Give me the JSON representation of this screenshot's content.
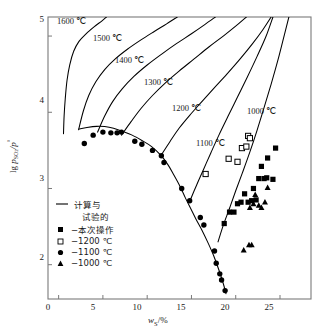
{
  "chart_data": {
    "type": "line",
    "title": "",
    "xlabel": "w_s/%",
    "ylabel": "lg p_so2 / p°",
    "xlim": [
      -1.2,
      28.5
    ],
    "ylim": [
      1.55,
      5.25
    ],
    "xticks": [
      0,
      5,
      10,
      15,
      20,
      25
    ],
    "yticks": [
      2,
      3,
      4,
      5
    ],
    "grid": false,
    "legend_position": "inside-lower-left",
    "annotations": [
      {
        "text": "1600 ℃",
        "x": 1.6,
        "y": 5.06
      },
      {
        "text": "1500 ℃",
        "x": 5.6,
        "y": 4.77
      },
      {
        "text": "1400 ℃",
        "x": 8.1,
        "y": 4.53
      },
      {
        "text": "1300 ℃",
        "x": 11.4,
        "y": 4.24
      },
      {
        "text": "1200 ℃",
        "x": 14.6,
        "y": 3.92
      },
      {
        "text": "1100 ℃",
        "x": 17.6,
        "y": 3.47
      },
      {
        "text": "1000 ℃",
        "x": 23.4,
        "y": 3.84
      }
    ],
    "series": [
      {
        "name": "计算与试验的",
        "kind": "line",
        "marker": "none",
        "color": "#000000",
        "points": [
          [
            2.3,
            3.78
          ],
          [
            3.2,
            3.8
          ],
          [
            4.3,
            3.815
          ],
          [
            5.2,
            3.812
          ],
          [
            6.2,
            3.79
          ],
          [
            7.2,
            3.75
          ],
          [
            8.3,
            3.7
          ],
          [
            9.4,
            3.63
          ],
          [
            10.5,
            3.55
          ],
          [
            11.5,
            3.44
          ],
          [
            12.3,
            3.32
          ],
          [
            13.0,
            3.18
          ],
          [
            13.7,
            3.03
          ],
          [
            14.3,
            2.88
          ],
          [
            14.9,
            2.74
          ],
          [
            15.5,
            2.6
          ],
          [
            16.2,
            2.45
          ],
          [
            16.9,
            2.28
          ],
          [
            17.5,
            2.12
          ],
          [
            18.1,
            1.93
          ],
          [
            18.6,
            1.75
          ],
          [
            18.9,
            1.62
          ]
        ]
      },
      {
        "name": "1600 ℃ isotherm",
        "kind": "line",
        "marker": "none",
        "color": "#000000",
        "points": [
          [
            0.55,
            3.72
          ],
          [
            0.62,
            3.95
          ],
          [
            0.75,
            4.18
          ],
          [
            0.95,
            4.42
          ],
          [
            1.25,
            4.62
          ],
          [
            1.7,
            4.8
          ],
          [
            2.3,
            4.93
          ],
          [
            3.1,
            5.03
          ],
          [
            4.0,
            5.12
          ],
          [
            4.9,
            5.2
          ],
          [
            5.4,
            5.25
          ]
        ]
      },
      {
        "name": "1500 ℃ isotherm",
        "kind": "line",
        "marker": "none",
        "color": "#000000",
        "points": [
          [
            2.25,
            3.77
          ],
          [
            2.8,
            4.02
          ],
          [
            3.4,
            4.22
          ],
          [
            4.2,
            4.4
          ],
          [
            5.2,
            4.56
          ],
          [
            6.4,
            4.7
          ],
          [
            7.8,
            4.83
          ],
          [
            9.3,
            4.95
          ],
          [
            10.8,
            5.06
          ],
          [
            12.2,
            5.16
          ],
          [
            13.4,
            5.25
          ]
        ]
      },
      {
        "name": "1400 ℃ isotherm",
        "kind": "line",
        "marker": "none",
        "color": "#000000",
        "points": [
          [
            4.4,
            3.74
          ],
          [
            5.2,
            3.95
          ],
          [
            6.1,
            4.14
          ],
          [
            7.2,
            4.31
          ],
          [
            8.5,
            4.47
          ],
          [
            10.0,
            4.62
          ],
          [
            11.6,
            4.76
          ],
          [
            13.3,
            4.9
          ],
          [
            15.0,
            5.03
          ],
          [
            16.5,
            5.15
          ],
          [
            17.7,
            5.25
          ]
        ]
      },
      {
        "name": "1300 ℃ isotherm",
        "kind": "line",
        "marker": "none",
        "color": "#000000",
        "points": [
          [
            7.1,
            3.7
          ],
          [
            8.2,
            3.88
          ],
          [
            9.3,
            4.05
          ],
          [
            10.6,
            4.22
          ],
          [
            12.0,
            4.38
          ],
          [
            13.6,
            4.54
          ],
          [
            15.3,
            4.7
          ],
          [
            17.0,
            4.86
          ],
          [
            18.7,
            5.01
          ],
          [
            20.2,
            5.15
          ],
          [
            21.2,
            5.25
          ]
        ]
      },
      {
        "name": "1200 ℃ isotherm",
        "kind": "line",
        "marker": "none",
        "color": "#000000",
        "points": [
          [
            11.6,
            3.44
          ],
          [
            12.6,
            3.62
          ],
          [
            13.6,
            3.79
          ],
          [
            14.8,
            3.96
          ],
          [
            16.1,
            4.13
          ],
          [
            17.5,
            4.31
          ],
          [
            19.0,
            4.5
          ],
          [
            20.5,
            4.7
          ],
          [
            21.9,
            4.9
          ],
          [
            23.1,
            5.09
          ],
          [
            24.0,
            5.25
          ]
        ]
      },
      {
        "name": "1100 ℃ isotherm",
        "kind": "line",
        "marker": "none",
        "color": "#000000",
        "points": [
          [
            14.8,
            2.83
          ],
          [
            15.6,
            3.05
          ],
          [
            16.4,
            3.26
          ],
          [
            17.2,
            3.47
          ],
          [
            18.1,
            3.7
          ],
          [
            19.1,
            3.94
          ],
          [
            20.2,
            4.2
          ],
          [
            21.3,
            4.46
          ],
          [
            22.4,
            4.73
          ],
          [
            23.4,
            4.99
          ],
          [
            24.2,
            5.25
          ]
        ]
      },
      {
        "name": "1000 ℃ isotherm",
        "kind": "line",
        "marker": "none",
        "color": "#000000",
        "points": [
          [
            18.0,
            2.3
          ],
          [
            18.6,
            2.52
          ],
          [
            19.3,
            2.74
          ],
          [
            20.0,
            2.97
          ],
          [
            20.8,
            3.22
          ],
          [
            21.6,
            3.48
          ],
          [
            22.4,
            3.76
          ],
          [
            23.2,
            4.06
          ],
          [
            24.0,
            4.37
          ],
          [
            24.8,
            4.7
          ],
          [
            25.5,
            5.02
          ],
          [
            26.0,
            5.25
          ]
        ]
      },
      {
        "name": "本次操作",
        "kind": "scatter",
        "marker": "filled-square",
        "color": "#000000",
        "points": [
          [
            18.7,
            2.54
          ],
          [
            19.3,
            2.69
          ],
          [
            19.8,
            2.69
          ],
          [
            20.2,
            2.8
          ],
          [
            20.6,
            2.82
          ],
          [
            21.0,
            2.93
          ],
          [
            21.4,
            2.82
          ],
          [
            21.8,
            2.84
          ],
          [
            22.0,
            3.0
          ],
          [
            22.3,
            2.85
          ],
          [
            22.6,
            3.13
          ],
          [
            22.9,
            3.29
          ],
          [
            23.2,
            3.13
          ],
          [
            23.5,
            3.14
          ],
          [
            23.6,
            3.4
          ],
          [
            24.2,
            3.12
          ],
          [
            24.5,
            3.53
          ]
        ]
      },
      {
        "name": "1200 ℃",
        "kind": "scatter",
        "marker": "open-square",
        "color": "#000000",
        "points": [
          [
            16.6,
            3.19
          ],
          [
            19.2,
            3.39
          ],
          [
            20.2,
            3.35
          ],
          [
            20.7,
            3.53
          ],
          [
            21.2,
            3.55
          ],
          [
            21.4,
            3.69
          ],
          [
            21.6,
            3.66
          ]
        ]
      },
      {
        "name": "1100 ℃",
        "kind": "scatter",
        "marker": "filled-circle",
        "color": "#000000",
        "points": [
          [
            2.9,
            3.59
          ],
          [
            3.9,
            3.7
          ],
          [
            5.0,
            3.74
          ],
          [
            5.9,
            3.73
          ],
          [
            6.6,
            3.73
          ],
          [
            7.1,
            3.74
          ],
          [
            8.6,
            3.62
          ],
          [
            9.4,
            3.58
          ],
          [
            10.6,
            3.5
          ],
          [
            11.6,
            3.43
          ],
          [
            11.9,
            3.34
          ],
          [
            13.9,
            3.0
          ],
          [
            14.8,
            2.84
          ],
          [
            16.0,
            2.62
          ],
          [
            16.4,
            2.52
          ],
          [
            17.6,
            2.18
          ],
          [
            17.8,
            2.02
          ],
          [
            18.2,
            1.88
          ],
          [
            18.4,
            1.8
          ],
          [
            18.8,
            1.66
          ]
        ]
      },
      {
        "name": "1000 ℃",
        "kind": "scatter",
        "marker": "filled-triangle",
        "color": "#000000",
        "points": [
          [
            20.9,
            2.19
          ],
          [
            21.5,
            2.26
          ],
          [
            21.8,
            2.26
          ],
          [
            21.6,
            2.75
          ],
          [
            22.0,
            2.8
          ],
          [
            22.2,
            2.92
          ],
          [
            22.6,
            2.78
          ],
          [
            22.9,
            2.75
          ],
          [
            23.3,
            2.82
          ],
          [
            23.6,
            3.01
          ]
        ]
      }
    ]
  },
  "axes": {
    "xticks": [
      "0",
      "5",
      "10",
      "15",
      "20",
      "25"
    ],
    "yticks": [
      "5",
      "4",
      "3",
      "2"
    ],
    "xlabel_main": "w",
    "xlabel_sub": "S",
    "xlabel_tail": "/%",
    "ylabel_lg": "lg ",
    "ylabel_p": "p",
    "ylabel_sub": "SO",
    "ylabel_sub2": "2",
    "ylabel_div": "/p",
    "ylabel_sup": "°"
  },
  "curve_labels": {
    "c1600": "1600 ℃",
    "c1500": "1500 ℃",
    "c1400": "1400 ℃",
    "c1300": "1300 ℃",
    "c1200": "1200 ℃",
    "c1100": "1100 ℃",
    "c1000": "1000 ℃"
  },
  "legend": {
    "items": [
      {
        "marker": "line",
        "label_line1": "计算与",
        "label_line2": "试验的"
      },
      {
        "marker": "filled-square",
        "label": "−本次操作"
      },
      {
        "marker": "open-square",
        "label": "−1200 ℃"
      },
      {
        "marker": "filled-circle",
        "label": "−1100 ℃"
      },
      {
        "marker": "filled-triangle",
        "label": "−1000 ℃"
      }
    ]
  },
  "colors": {
    "ink": "#000000",
    "axis": "#7a7a7a",
    "background": "#ffffff"
  }
}
